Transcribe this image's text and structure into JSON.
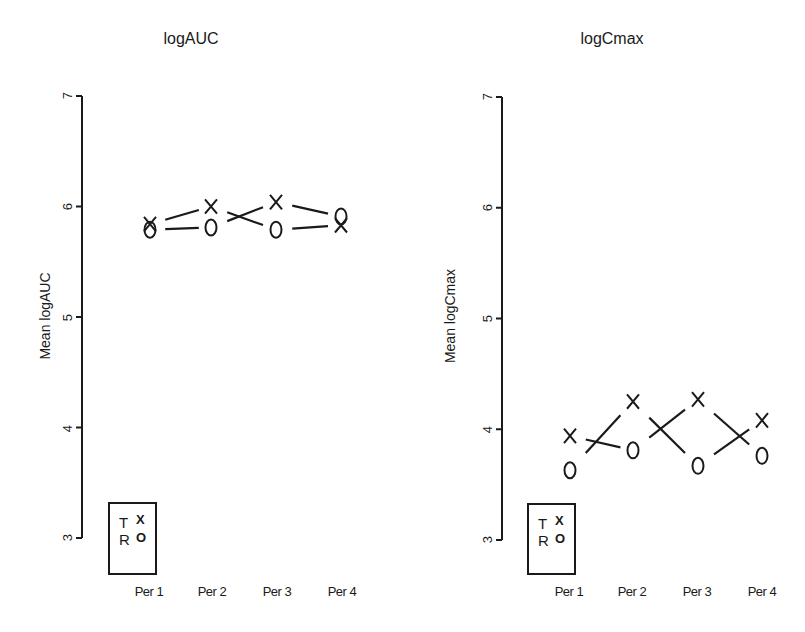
{
  "chart_data": [
    {
      "type": "scatter",
      "title": "logAUC",
      "xlabel": "",
      "ylabel": "Mean logAUC",
      "ylim": [
        3,
        7
      ],
      "yticks": [
        3,
        4,
        5,
        6,
        7
      ],
      "categories": [
        "Per 1",
        "Per 2",
        "Per 3",
        "Per 4"
      ],
      "grid": false,
      "legend": {
        "position": "bottom-left",
        "entries": [
          {
            "label": "T",
            "marker": "X"
          },
          {
            "label": "R",
            "marker": "O"
          }
        ]
      },
      "series": [
        {
          "name": "T",
          "marker": "X",
          "values": [
            5.84,
            6.0,
            6.04,
            5.83
          ]
        },
        {
          "name": "R",
          "marker": "O",
          "values": [
            5.79,
            5.81,
            5.79,
            5.91
          ]
        }
      ]
    },
    {
      "type": "scatter",
      "title": "logCmax",
      "xlabel": "",
      "ylabel": "Mean logCmax",
      "ylim": [
        3,
        7
      ],
      "yticks": [
        3,
        4,
        5,
        6,
        7
      ],
      "categories": [
        "Per 1",
        "Per 2",
        "Per 3",
        "Per 4"
      ],
      "grid": false,
      "legend": {
        "position": "bottom-left",
        "entries": [
          {
            "label": "T",
            "marker": "X"
          },
          {
            "label": "R",
            "marker": "O"
          }
        ]
      },
      "series": [
        {
          "name": "T",
          "marker": "X",
          "values": [
            3.94,
            4.25,
            4.27,
            4.08
          ]
        },
        {
          "name": "R",
          "marker": "O",
          "values": [
            3.63,
            3.81,
            3.67,
            3.76
          ]
        }
      ]
    }
  ],
  "left": {
    "title": "logAUC",
    "ylabel": "Mean logAUC",
    "yticks": [
      "3",
      "4",
      "5",
      "6",
      "7"
    ],
    "xticks": [
      "Per 1",
      "Per 2",
      "Per 3",
      "Per 4"
    ],
    "legend": {
      "t_label": "T",
      "t_symbol": "X",
      "r_label": "R",
      "r_symbol": "O"
    }
  },
  "right": {
    "title": "logCmax",
    "ylabel": "Mean logCmax",
    "yticks": [
      "3",
      "4",
      "5",
      "6",
      "7"
    ],
    "xticks": [
      "Per 1",
      "Per 2",
      "Per 3",
      "Per 4"
    ],
    "legend": {
      "t_label": "T",
      "t_symbol": "X",
      "r_label": "R",
      "r_symbol": "O"
    }
  }
}
